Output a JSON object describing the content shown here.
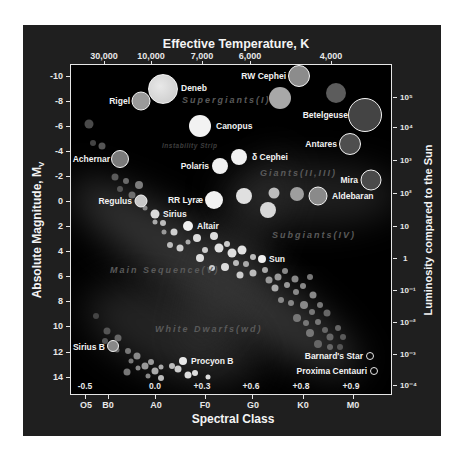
{
  "chart_data": {
    "type": "scatter",
    "top_axis": {
      "label": "Effective Temperature, K",
      "ticks": [
        "30,000",
        "10,000",
        "7,000",
        "6,000",
        "4,000"
      ]
    },
    "bottom_axis": {
      "label": "Spectral Class",
      "ticks": [
        "O5",
        "B0",
        "A0",
        "F0",
        "G0",
        "K0",
        "M0"
      ],
      "color_index_ticks": [
        "-0.5",
        "0.0",
        "+0.3",
        "+0.6",
        "+0.8",
        "+0.9"
      ]
    },
    "left_axis": {
      "label": "Absolute Magnitude, M",
      "label_subscript": "V",
      "ticks": [
        "-10",
        "-8",
        "-6",
        "-4",
        "-2",
        "0",
        "2",
        "4",
        "6",
        "8",
        "10",
        "12",
        "14"
      ],
      "ylim": [
        -10,
        14
      ]
    },
    "right_axis": {
      "label": "Luminosity compared to the Sun",
      "ticks": [
        "10⁵",
        "10⁴",
        "10³",
        "10²",
        "10",
        "1",
        "10⁻¹",
        "10⁻²",
        "10⁻³",
        "10⁻⁴"
      ]
    },
    "regions": [
      {
        "name": "Supergiants(I)"
      },
      {
        "name": "Instability Strip"
      },
      {
        "name": "Giants(II,III)"
      },
      {
        "name": "Subgiants(IV)"
      },
      {
        "name": "Main Sequence(V)"
      },
      {
        "name": "White Dwarfs(wd)"
      }
    ],
    "named_stars": [
      {
        "name": "Deneb",
        "spectral": "A2",
        "magnitude": -8.8
      },
      {
        "name": "Rigel",
        "spectral": "B8",
        "magnitude": -7.9
      },
      {
        "name": "RW Cephei",
        "spectral": "K0",
        "magnitude": -9.8
      },
      {
        "name": "Canopus",
        "spectral": "F0",
        "magnitude": -5.7
      },
      {
        "name": "Betelgeuse",
        "spectral": "M2",
        "magnitude": -5.7
      },
      {
        "name": "Achernar",
        "spectral": "B3",
        "magnitude": -3.3
      },
      {
        "name": "Antares",
        "spectral": "M1",
        "magnitude": -4.4
      },
      {
        "name": "Polaris",
        "spectral": "F7",
        "magnitude": -2.9
      },
      {
        "name": "δ Cephei",
        "spectral": "F8",
        "magnitude": -3.4
      },
      {
        "name": "Mira",
        "spectral": "M5",
        "magnitude": -1.7
      },
      {
        "name": "Aldebaran",
        "spectral": "K5",
        "magnitude": -0.4
      },
      {
        "name": "Regulus",
        "spectral": "B7",
        "magnitude": -0.1
      },
      {
        "name": "RR Lyræ",
        "spectral": "F5",
        "magnitude": 0.1
      },
      {
        "name": "Sirius",
        "spectral": "A1",
        "magnitude": 1.2
      },
      {
        "name": "Altair",
        "spectral": "A7",
        "magnitude": 2.1
      },
      {
        "name": "Sun",
        "spectral": "G2",
        "magnitude": 4.8
      },
      {
        "name": "Sirius B",
        "spectral": "B9",
        "magnitude": 11.6
      },
      {
        "name": "Procyon B",
        "spectral": "F5",
        "magnitude": 12.9
      },
      {
        "name": "Barnard's Star",
        "spectral": "M4",
        "magnitude": 12.7
      },
      {
        "name": "Proxima Centauri",
        "spectral": "M5",
        "magnitude": 13.8
      }
    ]
  },
  "labels": {
    "deneb": "Deneb",
    "rigel": "Rigel",
    "rw_cephei": "RW Cephei",
    "canopus": "Canopus",
    "betelgeuse": "Betelgeuse",
    "achernar": "Achernar",
    "antares": "Antares",
    "polaris": "Polaris",
    "delta_cephei": "δ Cephei",
    "mira": "Mira",
    "aldebaran": "Aldebaran",
    "regulus": "Regulus",
    "rr_lyrae": "RR Lyræ",
    "sirius": "Sirius",
    "altair": "Altair",
    "sun": "Sun",
    "sirius_b": "Sirius B",
    "procyon_b": "Procyon B",
    "barnards_star": "Barnard's Star",
    "proxima_centauri": "Proxima Centauri"
  },
  "regions": {
    "supergiants": "Supergiants(I)",
    "instability": "Instability Strip",
    "giants": "Giants(II,III)",
    "subgiants": "Subgiants(IV)",
    "main_sequence": "Main Sequence(V)",
    "white_dwarfs": "White Dwarfs(wd)"
  },
  "axes": {
    "top_title": "Effective Temperature, K",
    "bottom_title": "Spectral Class",
    "left_title": "Absolute Magnitude, M",
    "left_sub": "V",
    "right_title": "Luminosity compared to the Sun",
    "temp": [
      "30,000",
      "10,000",
      "7,000",
      "6,000",
      "4,000"
    ],
    "spectral": [
      "O5",
      "B0",
      "A0",
      "F0",
      "G0",
      "K0",
      "M0"
    ],
    "bv": [
      "-0.5",
      "0.0",
      "+0.3",
      "+0.6",
      "+0.8",
      "+0.9"
    ],
    "mag": [
      "-10",
      "-8",
      "-6",
      "-4",
      "-2",
      "0",
      "2",
      "4",
      "6",
      "8",
      "10",
      "12",
      "14"
    ],
    "lum": [
      "10⁵",
      "10⁴",
      "10³",
      "10²",
      "10",
      "1",
      "10⁻¹",
      "10⁻²",
      "10⁻³",
      "10⁻⁴"
    ]
  },
  "colors": {
    "panel": "#1f1f1f",
    "plot": "#000000",
    "frame": "#e6e6e6",
    "text": "#f2f2f2",
    "region_text": "#5a5a5a"
  }
}
